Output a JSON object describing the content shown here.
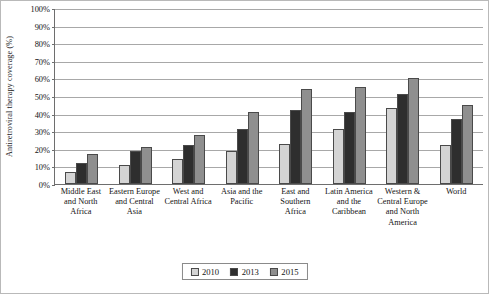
{
  "chart_data": {
    "type": "bar",
    "title": "",
    "subtitle": "",
    "xlabel": "",
    "ylabel": "Antiretroviral therapy coverage (%)",
    "ylim": [
      0,
      100
    ],
    "ytick_step": 10,
    "ytick_labels": [
      "100%",
      "90%",
      "80%",
      "70%",
      "60%",
      "50%",
      "40%",
      "30%",
      "20%",
      "10%",
      "0%"
    ],
    "grid": true,
    "legend_position": "bottom-center",
    "categories": [
      "Middle East and North Africa",
      "Eastern Europe and Central Asia",
      "West and Central Africa",
      "Asia and the Pacific",
      "East and Southern Africa",
      "Latin America and the Caribbean",
      "Western & Central Europe and North America",
      "World"
    ],
    "series": [
      {
        "name": "2010",
        "color": "#d4d4d4",
        "values": [
          7,
          11,
          14,
          19,
          23,
          31,
          43,
          22
        ]
      },
      {
        "name": "2013",
        "color": "#2e2e2e",
        "values": [
          12,
          19,
          22,
          31,
          42,
          41,
          51,
          37
        ]
      },
      {
        "name": "2015",
        "color": "#8f8f8f",
        "values": [
          17,
          21,
          28,
          41,
          54,
          55,
          60,
          45
        ]
      }
    ]
  },
  "legend": {
    "entries": [
      {
        "label": "2010",
        "swatch": "s2010"
      },
      {
        "label": "2013",
        "swatch": "s2013"
      },
      {
        "label": "2015",
        "swatch": "s2015"
      }
    ]
  }
}
